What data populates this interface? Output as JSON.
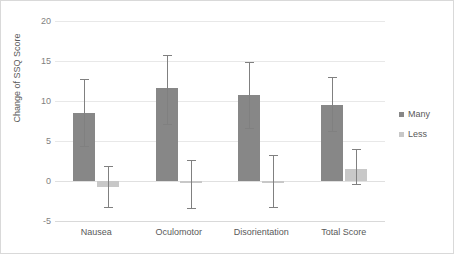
{
  "chart_data": {
    "type": "bar",
    "title": "",
    "xlabel": "",
    "ylabel": "Change of SSQ Score",
    "ylim": [
      -5,
      20
    ],
    "yticks": [
      20,
      15,
      10,
      5,
      0,
      -5
    ],
    "ytick_labels": [
      "20",
      "15",
      "10",
      "5",
      "0",
      "-5"
    ],
    "grid": true,
    "legend_position": "right",
    "categories": [
      "Nausea",
      "Oculomotor",
      "Disorientation",
      "Total Score"
    ],
    "series": [
      {
        "name": "Many",
        "color": "#878787",
        "values": [
          8.5,
          11.6,
          10.8,
          9.5
        ],
        "error_low": [
          4.4,
          7.1,
          6.6,
          6.2
        ],
        "error_high": [
          12.8,
          15.8,
          14.9,
          13.0
        ]
      },
      {
        "name": "Less",
        "color": "#c8c8c8",
        "values": [
          -0.8,
          -0.3,
          0.0,
          1.5
        ],
        "error_low": [
          -3.3,
          -3.4,
          -3.2,
          -0.4
        ],
        "error_high": [
          1.9,
          2.6,
          3.2,
          4.0
        ]
      }
    ]
  },
  "legend": {
    "items": [
      {
        "label": "Many",
        "color": "#878787"
      },
      {
        "label": "Less",
        "color": "#c8c8c8"
      }
    ]
  }
}
